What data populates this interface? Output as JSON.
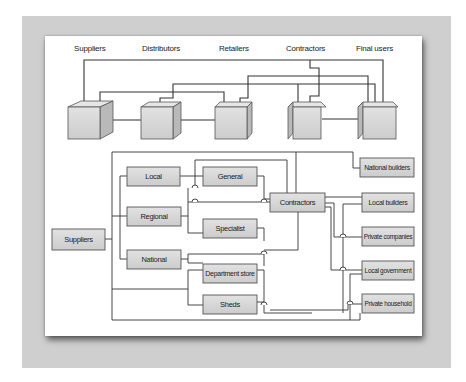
{
  "figure": {
    "top_diagram": {
      "title": "Channel structure",
      "stage_labels": [
        "Suppliers",
        "Distributors",
        "Retailers",
        "Contractors",
        "Final users"
      ],
      "nodes": [
        {
          "id": "suppliers",
          "label": "Suppliers"
        },
        {
          "id": "distributors",
          "label": "Distributors"
        },
        {
          "id": "retailers",
          "label": "Retailers"
        },
        {
          "id": "contractors",
          "label": "Contractors"
        },
        {
          "id": "final_users",
          "label": "Final users"
        }
      ]
    },
    "bottom_diagram": {
      "boxes": {
        "suppliers": "Suppliers",
        "local": "Local",
        "regional": "Regional",
        "national": "National",
        "general": "General",
        "specialist": "Specialist",
        "department_store": "Department store",
        "sheds": "Sheds",
        "contractors": "Contractors",
        "national_builders": "National builders",
        "local_builders": "Local builders",
        "private_companies": "Private companies",
        "local_government": "Local government",
        "private_household": "Private household"
      }
    },
    "colors": {
      "frame": "#cfcfcf",
      "panel": "#ffffff",
      "box_fill": "#d4d4d4",
      "box_border": "#555555",
      "line": "#333333"
    }
  }
}
